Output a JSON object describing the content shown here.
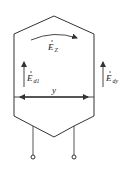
{
  "diagram": {
    "labels": {
      "ez": {
        "main": "E",
        "sub": "Z"
      },
      "ed1": {
        "main": "E",
        "sub": "d1"
      },
      "edy": {
        "main": "E",
        "sub": "dy"
      },
      "span": "y"
    },
    "colors": {
      "stroke": "#333333",
      "background": "#ffffff"
    }
  }
}
